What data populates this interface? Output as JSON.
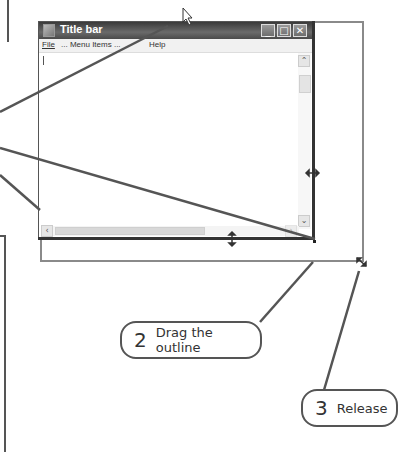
{
  "window": {
    "title": "Title bar",
    "controls": {
      "minimize": "_",
      "maximize": "□",
      "close": "✕"
    },
    "menu": [
      {
        "label": "File"
      },
      {
        "label": "... Menu Items ..."
      },
      {
        "label": "Help"
      }
    ],
    "vscroll": {
      "up": "⌃",
      "down": "⌄"
    },
    "hscroll": {
      "left": "‹",
      "right": "›"
    }
  },
  "callouts": [
    {
      "number": "2",
      "label": "Drag the outline"
    },
    {
      "number": "3",
      "label": "Release"
    }
  ],
  "colors": {
    "line": "#555555",
    "outline": "#8a8a8a",
    "titlebar": "#4a4a4a"
  }
}
